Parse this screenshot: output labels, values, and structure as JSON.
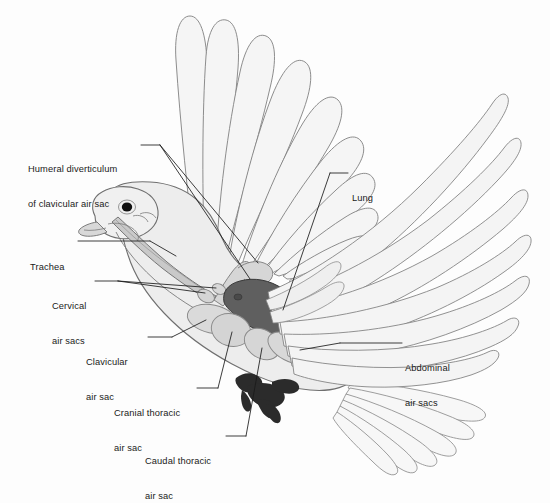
{
  "figure": {
    "background_color": "#fdfdfd",
    "ink_color": "#3c3c3c",
    "leader_color": "#1a1a1a"
  },
  "palette": {
    "body_fill": "#ececec",
    "body_stroke": "#6e6e6e",
    "feather_fill": "#f4f4f4",
    "feather_stroke": "#7b7b7b",
    "lung_fill": "#5f5f5f",
    "lung_stroke": "#3a3a3a",
    "airsac_fill": "#d2d2d2",
    "airsac_stroke": "#8a8a8a",
    "airsac_fill_light": "#dcdcdc",
    "trachea_fill": "#c9c9c9",
    "foot_fill": "#2b2b2b",
    "eye_fill": "#111111",
    "beak_fill": "#d8d8d8"
  },
  "labels": [
    {
      "id": "humeral-diverticulum",
      "line1": "Humeral diverticulum",
      "line2": "of clavicular air sac",
      "x": 28,
      "y": 141
    },
    {
      "id": "trachea",
      "line1": "Trachea",
      "line2": "",
      "x": 30,
      "y": 239
    },
    {
      "id": "cervical-air-sacs",
      "line1": "Cervical",
      "line2": "air sacs",
      "x": 52,
      "y": 278
    },
    {
      "id": "clavicular-air-sac",
      "line1": "Clavicular",
      "line2": "air sac",
      "x": 86,
      "y": 334
    },
    {
      "id": "cranial-thoracic-air-sac",
      "line1": "Cranial thoracic",
      "line2": "air sac",
      "x": 114,
      "y": 385
    },
    {
      "id": "caudal-thoracic-air-sac",
      "line1": "Caudal thoracic",
      "line2": "air sac",
      "x": 145,
      "y": 433
    },
    {
      "id": "lung",
      "line1": "Lung",
      "line2": "",
      "x": 352,
      "y": 170
    },
    {
      "id": "abdominal-air-sacs",
      "line1": "Abdominal",
      "line2": "air sacs",
      "x": 405,
      "y": 340
    }
  ]
}
